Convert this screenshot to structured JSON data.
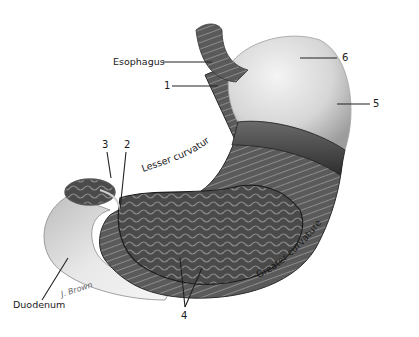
{
  "figure": {
    "labels": {
      "esophagus": "Esophagus",
      "duodenum": "Duodenum",
      "lesser_curvature": "Lesser curvature",
      "greater_curvature": "Greater curvature",
      "n1": "1",
      "n2": "2",
      "n3": "3",
      "n4": "4",
      "n5": "5",
      "n6": "6"
    },
    "signature": "J. Brown",
    "colors": {
      "background": "#ffffff",
      "label_text": "#1a1a1a",
      "leader_line": "#222222",
      "fundus_light": "#e6e6e6",
      "fundus_shade": "#9a9a9a",
      "muscle_dark": "#3a3a3a",
      "mucosa_dark": "#4a4a4a"
    }
  }
}
